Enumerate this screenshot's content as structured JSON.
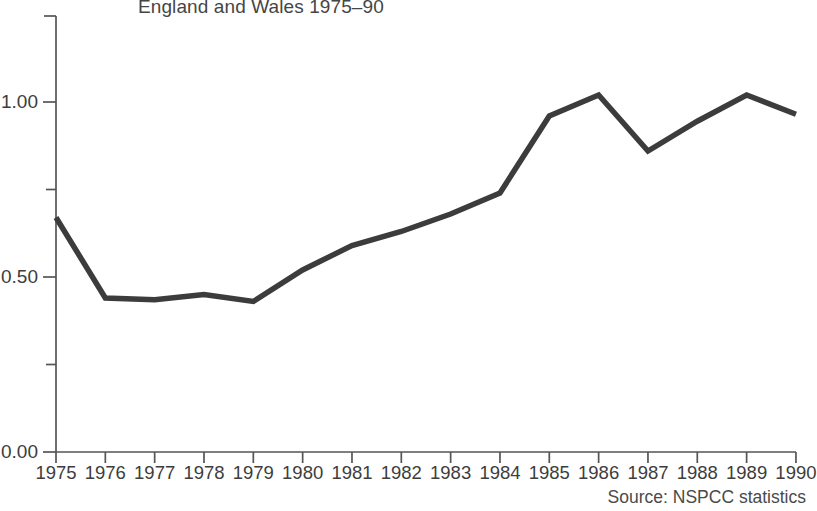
{
  "chart_data": {
    "type": "line",
    "title": "England and Wales 1975–90",
    "xlabel": "",
    "ylabel": "",
    "categories": [
      "1975",
      "1976",
      "1977",
      "1978",
      "1979",
      "1980",
      "1981",
      "1982",
      "1983",
      "1984",
      "1985",
      "1986",
      "1987",
      "1988",
      "1989",
      "1990"
    ],
    "values": [
      0.67,
      0.44,
      0.435,
      0.45,
      0.43,
      0.52,
      0.59,
      0.63,
      0.68,
      0.74,
      0.96,
      1.02,
      0.86,
      0.945,
      1.02,
      0.965
    ],
    "ylim": [
      0.0,
      1.25
    ],
    "xlim": [
      "1975",
      "1990"
    ],
    "ytick_labels": [
      "1.00",
      "0.50",
      "0.00"
    ],
    "ytick_values": [
      1.0,
      0.5,
      0.0
    ],
    "yminor_values": [
      1.25,
      0.75,
      0.25
    ],
    "grid": false,
    "legend": null,
    "annotations": [
      "Source: NSPCC statistics"
    ],
    "line_color": "#3c3c3c",
    "axis_color": "#555555",
    "background_color": "#ffffff"
  },
  "labels": {
    "title": "England and Wales 1975–90",
    "source": "Source: NSPCC statistics"
  }
}
